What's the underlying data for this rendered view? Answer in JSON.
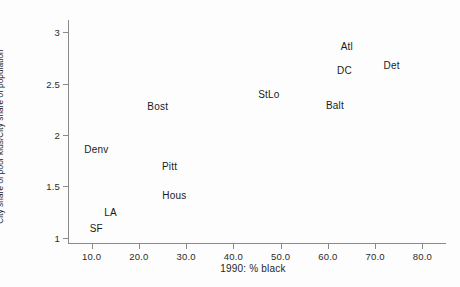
{
  "chart_data": {
    "type": "scatter",
    "title": "",
    "xlabel": "1990: % black",
    "ylabel": "City share of poor kids/City share of population",
    "xlim": [
      5.0,
      85.0
    ],
    "ylim": [
      0.95,
      3.12
    ],
    "grid": false,
    "legend": null,
    "point_style": "text-labels-only",
    "xticks": [
      "10.0",
      "20.0",
      "30.0",
      "40.0",
      "50.0",
      "60.0",
      "70.0",
      "80.0"
    ],
    "xtick_values": [
      10.0,
      20.0,
      30.0,
      40.0,
      50.0,
      60.0,
      70.0,
      80.0
    ],
    "yticks": [
      "1",
      "1.5",
      "2",
      "2.5",
      "3"
    ],
    "ytick_values": [
      1,
      1.5,
      2,
      2.5,
      3
    ],
    "points": [
      {
        "label": "Atl",
        "x": 64.0,
        "y": 2.87
      },
      {
        "label": "Det",
        "x": 73.5,
        "y": 2.68
      },
      {
        "label": "DC",
        "x": 63.5,
        "y": 2.63
      },
      {
        "label": "StLo",
        "x": 47.5,
        "y": 2.4
      },
      {
        "label": "Balt",
        "x": 61.5,
        "y": 2.29
      },
      {
        "label": "Bost",
        "x": 24.0,
        "y": 2.28
      },
      {
        "label": "Denv",
        "x": 11.0,
        "y": 1.86
      },
      {
        "label": "Pitt",
        "x": 26.5,
        "y": 1.7
      },
      {
        "label": "Hous",
        "x": 27.5,
        "y": 1.42
      },
      {
        "label": "LA",
        "x": 14.0,
        "y": 1.25
      },
      {
        "label": "SF",
        "x": 11.0,
        "y": 1.1
      }
    ]
  }
}
